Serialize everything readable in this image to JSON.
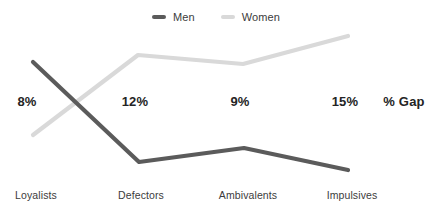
{
  "chart_data": {
    "type": "line",
    "title": "",
    "xlabel": "",
    "ylabel": "",
    "legend_position": "top-center",
    "grid": false,
    "categories": [
      "Loyalists",
      "Defectors",
      "Ambivalents",
      "Impulsives"
    ],
    "series": [
      {
        "name": "Men",
        "color": "#5b5b5b",
        "values": [
          76,
          33,
          41,
          28
        ],
        "points_px": [
          {
            "x": 33,
            "y": 62
          },
          {
            "x": 139,
            "y": 162
          },
          {
            "x": 244,
            "y": 148
          },
          {
            "x": 348,
            "y": 170
          }
        ]
      },
      {
        "name": "Women",
        "color": "#d9d9d9",
        "values": [
          32,
          69,
          64,
          81
        ],
        "points_px": [
          {
            "x": 33,
            "y": 135
          },
          {
            "x": 138,
            "y": 55
          },
          {
            "x": 243,
            "y": 64
          },
          {
            "x": 348,
            "y": 36
          }
        ]
      }
    ],
    "annotations": {
      "label": "% Gap",
      "values": [
        "8%",
        "12%",
        "9%",
        "15%"
      ]
    }
  },
  "legend": {
    "items": [
      {
        "label": "Men",
        "color": "#5b5b5b",
        "swatch_name": "legend-swatch-men"
      },
      {
        "label": "Women",
        "color": "#d9d9d9",
        "swatch_name": "legend-swatch-women"
      }
    ]
  },
  "gap_row": {
    "axis_title": "% Gap",
    "cells": [
      {
        "value": "8%",
        "x": 27,
        "y": 101
      },
      {
        "value": "12%",
        "x": 135,
        "y": 101
      },
      {
        "value": "9%",
        "x": 240,
        "y": 101
      },
      {
        "value": "15%",
        "x": 345,
        "y": 101
      },
      {
        "value": "% Gap",
        "x": 404,
        "y": 101
      }
    ]
  },
  "category_axis": {
    "labels": [
      {
        "text": "Loyalists",
        "x": 36,
        "y": 195
      },
      {
        "text": "Defectors",
        "x": 141,
        "y": 195
      },
      {
        "text": "Ambivalents",
        "x": 248,
        "y": 195
      },
      {
        "text": "Impulsives",
        "x": 352,
        "y": 195
      }
    ]
  },
  "colors": {
    "men": "#5b5b5b",
    "women": "#d9d9d9",
    "text": "#3c3c3c",
    "text_bold": "#242424",
    "background": "#ffffff"
  }
}
